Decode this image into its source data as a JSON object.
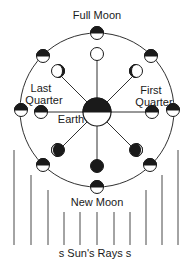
{
  "labels": {
    "full_moon": "Full Moon",
    "new_moon": "New Moon",
    "first_quarter_line1": "First",
    "first_quarter_line2": "Quarter",
    "last_quarter_line1": "Last",
    "last_quarter_line2": "Quarter",
    "earth": "Earth",
    "suns_rays": "s Sun's Rays s"
  },
  "colors": {
    "ink": "#1a1a1a",
    "background": "#ffffff"
  },
  "orbit": {
    "cx": 97,
    "cy": 110,
    "r": 77
  },
  "earth": {
    "cx": 97,
    "cy": 112,
    "r": 14,
    "lit_side": "bottom"
  },
  "outer_moons": [
    {
      "name": "full",
      "angle_deg": 90,
      "lit_side": "bottom"
    },
    {
      "name": "waxing-gibbous",
      "angle_deg": 45,
      "lit_side": "bottom"
    },
    {
      "name": "first-quarter",
      "angle_deg": 0,
      "lit_side": "bottom"
    },
    {
      "name": "waxing-crescent",
      "angle_deg": -45,
      "lit_side": "bottom"
    },
    {
      "name": "new",
      "angle_deg": -90,
      "lit_side": "bottom"
    },
    {
      "name": "waning-crescent",
      "angle_deg": -135,
      "lit_side": "bottom"
    },
    {
      "name": "last-quarter",
      "angle_deg": 180,
      "lit_side": "bottom"
    },
    {
      "name": "waning-gibbous",
      "angle_deg": 135,
      "lit_side": "bottom"
    }
  ],
  "inner_moons": [
    {
      "name": "full",
      "appearance": "fully-lit"
    },
    {
      "name": "waxing-gibbous",
      "appearance": "gibbous-right"
    },
    {
      "name": "first-quarter",
      "appearance": "half-lit"
    },
    {
      "name": "waxing-crescent",
      "appearance": "crescent-right"
    },
    {
      "name": "new",
      "appearance": "dark"
    },
    {
      "name": "waning-crescent",
      "appearance": "crescent-left"
    },
    {
      "name": "last-quarter",
      "appearance": "half-lit"
    },
    {
      "name": "waning-gibbous",
      "appearance": "gibbous-left"
    }
  ],
  "sun_rays": {
    "count": 11
  }
}
